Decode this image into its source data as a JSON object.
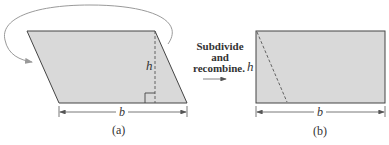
{
  "figure": {
    "panel_a": {
      "caption": "(a)",
      "height_label": "h",
      "base_label": "b",
      "shape": "parallelogram"
    },
    "transition": {
      "line1": "Subdivide",
      "line2": "and",
      "line3": "recombine."
    },
    "panel_b": {
      "caption": "(b)",
      "height_label": "h",
      "base_label": "b",
      "shape": "rectangle"
    },
    "colors": {
      "fill": "#d9d9d9",
      "stroke": "#444444",
      "curve": "#9a9a9a"
    }
  }
}
